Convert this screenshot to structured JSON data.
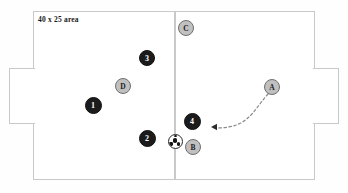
{
  "diagram": {
    "area_label": "40 x 25 area",
    "background_color": "#fefefe",
    "line_color": "#c9c9c9",
    "dark_team_color": "#1b1b1b",
    "light_team_color": "#c0c0c0",
    "arrow_color": "#8a8a8a"
  },
  "pitch": {
    "name": "playing-field",
    "halfway_line": "center-line",
    "goals": [
      {
        "id": "goal-left",
        "side": "left"
      },
      {
        "id": "goal-right",
        "side": "right"
      }
    ]
  },
  "players": [
    {
      "id": "player-1",
      "label": "1",
      "team": "dark",
      "x": 93,
      "y": 105,
      "size": 17
    },
    {
      "id": "player-2",
      "label": "2",
      "team": "dark",
      "x": 147,
      "y": 138,
      "size": 17
    },
    {
      "id": "player-3",
      "label": "3",
      "team": "dark",
      "x": 147,
      "y": 58,
      "size": 16
    },
    {
      "id": "player-4",
      "label": "4",
      "team": "dark",
      "x": 192,
      "y": 121,
      "size": 17
    },
    {
      "id": "player-a",
      "label": "A",
      "team": "light",
      "x": 272,
      "y": 87,
      "size": 16
    },
    {
      "id": "player-b",
      "label": "B",
      "team": "light",
      "x": 193,
      "y": 147,
      "size": 16
    },
    {
      "id": "player-c",
      "label": "C",
      "team": "light",
      "x": 186,
      "y": 28,
      "size": 16
    },
    {
      "id": "player-d",
      "label": "D",
      "team": "light",
      "x": 123,
      "y": 86,
      "size": 16
    }
  ],
  "ball": {
    "id": "soccer-ball",
    "x": 174,
    "y": 140,
    "size": 13
  },
  "movement": {
    "id": "run-arrow-a-to-4",
    "from_player": "A",
    "to_player": "4",
    "style": "dashed-curve",
    "path": "M 268 94 C 259 104, 254 114, 244 121 C 236 127, 224 128, 216 128",
    "arrowhead_x": 211,
    "arrowhead_y": 127
  }
}
